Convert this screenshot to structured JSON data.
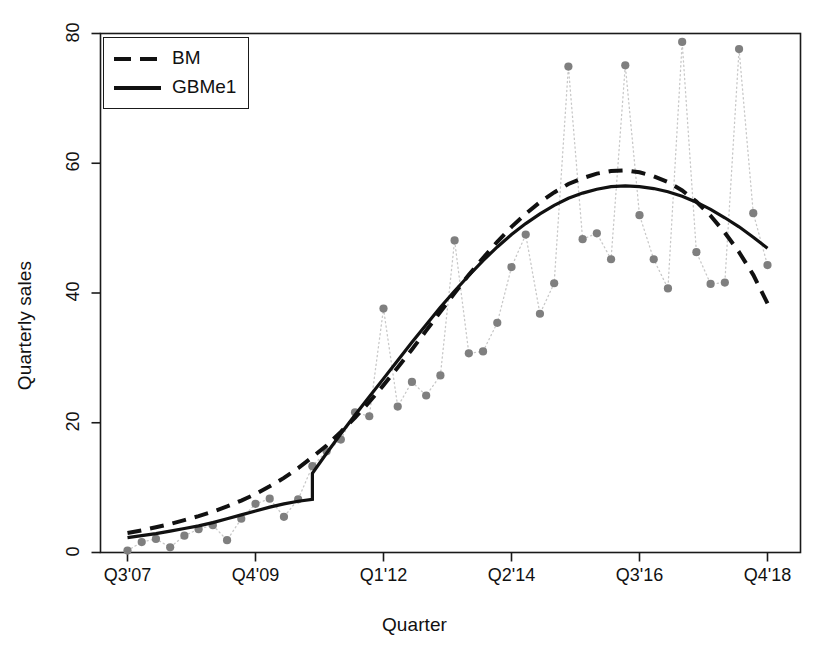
{
  "chart_data": {
    "type": "line",
    "title": "",
    "xlabel": "Quarter",
    "ylabel": "Quarterly sales",
    "grid": false,
    "legend_position": "top-left",
    "xlim": [
      0,
      46
    ],
    "ylim": [
      0,
      80
    ],
    "ytick_values": [
      0,
      20,
      40,
      60,
      80
    ],
    "ytick_labels": [
      "0",
      "20",
      "40",
      "60",
      "80"
    ],
    "xtick_positions": [
      0,
      9,
      18,
      27,
      36,
      45
    ],
    "xtick_labels": [
      "Q3'07",
      "Q4'09",
      "Q1'12",
      "Q2'14",
      "Q3'16",
      "Q4'18"
    ],
    "observed": {
      "name": "Observed quarterly sales",
      "marker": "filled-circle",
      "marker_color": "#7f7f7f",
      "line_style": "dotted",
      "line_color": "#c8c8c8",
      "x": [
        0,
        1,
        2,
        3,
        4,
        5,
        6,
        7,
        8,
        9,
        10,
        11,
        12,
        13,
        14,
        15,
        16,
        17,
        18,
        19,
        20,
        21,
        22,
        23,
        24,
        25,
        26,
        27,
        28,
        29,
        30,
        31,
        32,
        33,
        34,
        35,
        36,
        37,
        38,
        39,
        40,
        41,
        42,
        43,
        44,
        45
      ],
      "values": [
        0.3,
        1.6,
        2.1,
        0.8,
        2.6,
        3.6,
        4.2,
        1.9,
        5.2,
        7.5,
        8.3,
        5.5,
        8.2,
        13.3,
        15.6,
        17.4,
        21.6,
        21.0,
        37.6,
        22.5,
        26.3,
        24.2,
        27.3,
        48.1,
        30.7,
        31.0,
        35.4,
        44.0,
        49.0,
        36.8,
        41.5,
        74.9,
        48.3,
        49.2,
        45.2,
        75.1,
        52.0,
        45.2,
        40.7,
        78.7,
        46.3,
        41.4,
        41.6,
        77.6,
        52.3,
        44.3
      ]
    },
    "series": [
      {
        "name": "BM",
        "line_style": "dashed",
        "line_color": "#111111",
        "x": [
          0,
          1,
          2,
          3,
          4,
          5,
          6,
          7,
          8,
          9,
          10,
          11,
          12,
          13,
          14,
          15,
          16,
          17,
          18,
          19,
          20,
          21,
          22,
          23,
          24,
          25,
          26,
          27,
          28,
          29,
          30,
          31,
          32,
          33,
          34,
          35,
          36,
          37,
          38,
          39,
          40,
          41,
          42,
          43,
          44,
          45
        ],
        "values": [
          3.0,
          3.4,
          3.9,
          4.4,
          5.0,
          5.6,
          6.3,
          7.1,
          8.0,
          9.0,
          10.2,
          11.5,
          13.0,
          14.7,
          16.5,
          18.6,
          20.8,
          23.2,
          25.8,
          28.5,
          31.3,
          34.2,
          37.1,
          40.0,
          42.8,
          45.4,
          47.9,
          50.2,
          52.2,
          54.0,
          55.5,
          56.8,
          57.7,
          58.4,
          58.8,
          58.9,
          58.6,
          58.0,
          57.1,
          55.8,
          54.1,
          51.9,
          49.3,
          46.3,
          42.8,
          38.4
        ]
      },
      {
        "name": "GBMe1",
        "line_style": "solid",
        "line_color": "#111111",
        "has_jump": true,
        "jump_at_x": 13,
        "jump_from": 8.2,
        "jump_to": 12.2,
        "x": [
          0,
          1,
          2,
          3,
          4,
          5,
          6,
          7,
          8,
          9,
          10,
          11,
          12,
          13,
          13,
          14,
          15,
          16,
          17,
          18,
          19,
          20,
          21,
          22,
          23,
          24,
          25,
          26,
          27,
          28,
          29,
          30,
          31,
          32,
          33,
          34,
          35,
          36,
          37,
          38,
          39,
          40,
          41,
          42,
          43,
          44,
          45
        ],
        "values": [
          2.3,
          2.6,
          2.9,
          3.3,
          3.7,
          4.1,
          4.6,
          5.2,
          5.8,
          6.4,
          7.0,
          7.5,
          7.9,
          8.2,
          12.2,
          15.3,
          18.3,
          21.2,
          24.0,
          26.8,
          29.6,
          32.4,
          35.1,
          37.8,
          40.3,
          42.7,
          45.0,
          47.1,
          49.0,
          50.7,
          52.2,
          53.5,
          54.6,
          55.4,
          56.0,
          56.4,
          56.5,
          56.4,
          56.1,
          55.6,
          54.9,
          54.0,
          52.9,
          51.6,
          50.2,
          48.6,
          46.9
        ]
      }
    ]
  },
  "legend": {
    "entries": [
      {
        "label": "BM",
        "style": "dashed"
      },
      {
        "label": "GBMe1",
        "style": "solid"
      }
    ]
  }
}
